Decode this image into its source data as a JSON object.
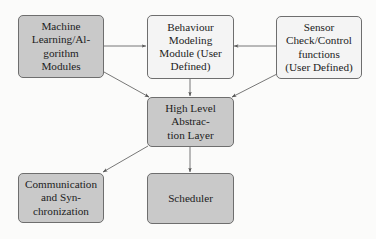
{
  "diagram": {
    "type": "block-diagram",
    "colors": {
      "shaded_fill": "#c9c9c9",
      "plain_fill": "#f4f4f4",
      "border": "#6e6e6e",
      "arrow": "#555555"
    },
    "nodes": [
      {
        "id": "ml",
        "label": "Machine\nLearning/Al-\ngorithm\nModules",
        "style": "shaded"
      },
      {
        "id": "behaviour",
        "label": "Behaviour\nModeling\nModule (User\nDefined)",
        "style": "plain"
      },
      {
        "id": "sensor",
        "label": "Sensor\nCheck/Control\nfunctions\n(User Defined)",
        "style": "plain"
      },
      {
        "id": "hal",
        "label": "High Level\nAbstrac-\ntion Layer",
        "style": "shaded"
      },
      {
        "id": "comm",
        "label": "Communication\nand Syn-\nchronization",
        "style": "shaded"
      },
      {
        "id": "scheduler",
        "label": "Scheduler",
        "style": "shaded"
      }
    ],
    "edges": [
      {
        "from": "ml",
        "to": "behaviour"
      },
      {
        "from": "sensor",
        "to": "behaviour"
      },
      {
        "from": "ml",
        "to": "hal"
      },
      {
        "from": "behaviour",
        "to": "hal"
      },
      {
        "from": "sensor",
        "to": "hal"
      },
      {
        "from": "hal",
        "to": "comm"
      },
      {
        "from": "hal",
        "to": "scheduler"
      }
    ]
  }
}
